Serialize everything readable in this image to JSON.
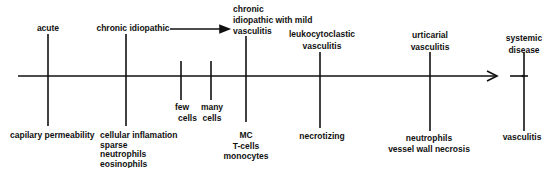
{
  "diagram": {
    "type": "timeline",
    "colors": {
      "line": "#111111",
      "background": "#ffffff"
    },
    "top_labels": {
      "acute": "acute",
      "chronic_idiopathic": "chronic idiopathic",
      "chronic_mild": [
        "chronic",
        "idiopathic with mild",
        "vasculitis"
      ],
      "leukocytoclastic": [
        "leukocytoclastic",
        "vasculitis"
      ],
      "urticarial": [
        "urticarial",
        "vasculitis"
      ],
      "systemic": [
        "systemic",
        "disease"
      ]
    },
    "middle_labels": {
      "few_cells": [
        "few",
        "cells"
      ],
      "many_cells": [
        "many",
        "cells"
      ]
    },
    "bottom_labels": {
      "acute": "capilary permeability",
      "chronic_idiopathic": [
        "cellular inflamation",
        "sparse",
        "neutrophils",
        "eosinophils"
      ],
      "chronic_mild": [
        "MC",
        "T-cells",
        "monocytes"
      ],
      "leukocytoclastic": "necrotizing",
      "urticarial": [
        "neutrophils",
        "vessel wall necrosis"
      ],
      "systemic": "vasculitis"
    }
  }
}
